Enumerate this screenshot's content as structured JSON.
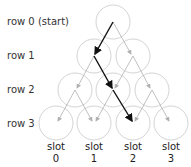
{
  "rows": [
    {
      "label": "row 0 (start)",
      "y": 22
    },
    {
      "label": "row 1",
      "y": 56
    },
    {
      "label": "row 2",
      "y": 90
    },
    {
      "label": "row 3",
      "y": 123
    }
  ],
  "slots": [
    {
      "word": "slot",
      "num": "0",
      "x": 56
    },
    {
      "word": "slot",
      "num": "1",
      "x": 94
    },
    {
      "word": "slot",
      "num": "2",
      "x": 133
    },
    {
      "word": "slot",
      "num": "3",
      "x": 171
    }
  ],
  "colors": {
    "circle": "#c8c8c8",
    "grey_arrow": "#b0b0b0",
    "path_arrow": "#111111",
    "text": "#333333"
  },
  "path": [
    "row0",
    "row1-left",
    "row2-middle",
    "row3-slot2"
  ]
}
